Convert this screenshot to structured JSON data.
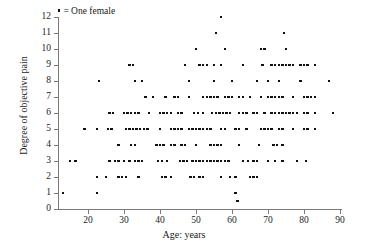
{
  "figure": {
    "legend_text": "= One female",
    "legend_marker": "square-dot-marker"
  },
  "chart_data": {
    "type": "scatter",
    "title": "",
    "xlabel": "Age: years",
    "ylabel": "Degree of objective pain",
    "xlim": [
      12,
      91
    ],
    "ylim": [
      0,
      12
    ],
    "xticks": [
      20,
      30,
      40,
      50,
      60,
      70,
      80,
      90
    ],
    "yticks": [
      0,
      1,
      2,
      3,
      4,
      5,
      6,
      7,
      8,
      9,
      10,
      11,
      12
    ],
    "grid": false,
    "legend_position": "top-left",
    "legend_entries": [
      "= One female"
    ],
    "marker": "square",
    "marker_color": "#111111",
    "marker_size_px": 2.4,
    "note": "Each point represents one female subject; many points overlap at integer pain levels.",
    "points": [
      [
        13,
        1
      ],
      [
        22.5,
        1
      ],
      [
        61,
        1
      ],
      [
        61.5,
        0.5
      ],
      [
        15,
        3
      ],
      [
        16.5,
        3
      ],
      [
        22.5,
        2
      ],
      [
        25,
        2
      ],
      [
        28.5,
        2
      ],
      [
        29.5,
        2
      ],
      [
        30.5,
        2
      ],
      [
        34,
        2
      ],
      [
        40.5,
        2
      ],
      [
        41.5,
        2
      ],
      [
        43,
        2
      ],
      [
        48.5,
        2
      ],
      [
        49.5,
        2
      ],
      [
        51,
        2
      ],
      [
        52,
        2
      ],
      [
        57,
        2
      ],
      [
        59.5,
        2
      ],
      [
        61,
        2
      ],
      [
        65,
        2
      ],
      [
        66,
        2
      ],
      [
        67,
        2
      ],
      [
        26,
        3
      ],
      [
        27.5,
        3
      ],
      [
        28.5,
        3
      ],
      [
        30,
        3
      ],
      [
        31.5,
        3
      ],
      [
        33,
        3
      ],
      [
        34,
        3
      ],
      [
        35,
        3
      ],
      [
        39.5,
        3
      ],
      [
        40.5,
        3
      ],
      [
        42,
        3
      ],
      [
        45.5,
        3
      ],
      [
        46.5,
        3
      ],
      [
        47.5,
        3
      ],
      [
        49,
        3
      ],
      [
        50,
        3
      ],
      [
        51,
        3
      ],
      [
        52,
        3
      ],
      [
        53,
        3
      ],
      [
        54,
        3
      ],
      [
        55,
        3
      ],
      [
        56,
        3
      ],
      [
        57,
        3
      ],
      [
        58,
        3
      ],
      [
        59,
        3
      ],
      [
        63,
        3
      ],
      [
        64.5,
        3
      ],
      [
        66,
        3
      ],
      [
        67,
        3
      ],
      [
        70,
        3
      ],
      [
        72,
        3
      ],
      [
        74,
        3
      ],
      [
        78,
        3
      ],
      [
        80.5,
        3
      ],
      [
        28.5,
        4
      ],
      [
        32,
        4
      ],
      [
        33,
        4
      ],
      [
        39,
        4
      ],
      [
        40,
        4
      ],
      [
        41,
        4
      ],
      [
        43,
        4
      ],
      [
        44,
        4
      ],
      [
        46,
        4
      ],
      [
        47,
        4
      ],
      [
        50,
        4
      ],
      [
        54,
        4
      ],
      [
        55,
        4
      ],
      [
        56,
        4
      ],
      [
        57,
        4
      ],
      [
        62,
        4
      ],
      [
        67.5,
        4
      ],
      [
        71.5,
        4
      ],
      [
        72.5,
        4
      ],
      [
        74,
        4
      ],
      [
        19,
        5
      ],
      [
        22.5,
        5
      ],
      [
        25.5,
        5
      ],
      [
        26.5,
        5
      ],
      [
        30.5,
        5
      ],
      [
        31.5,
        5
      ],
      [
        32.5,
        5
      ],
      [
        33.5,
        5
      ],
      [
        34.5,
        5
      ],
      [
        35.5,
        5
      ],
      [
        36.5,
        5
      ],
      [
        40,
        5
      ],
      [
        43,
        5
      ],
      [
        44,
        5
      ],
      [
        45,
        5
      ],
      [
        46,
        5
      ],
      [
        48,
        5
      ],
      [
        49,
        5
      ],
      [
        50,
        5
      ],
      [
        51,
        5
      ],
      [
        52,
        5
      ],
      [
        53,
        5
      ],
      [
        54,
        5
      ],
      [
        57,
        5
      ],
      [
        58,
        5
      ],
      [
        61,
        5
      ],
      [
        62,
        5
      ],
      [
        64,
        5
      ],
      [
        68,
        5
      ],
      [
        69,
        5
      ],
      [
        70,
        5
      ],
      [
        71,
        5
      ],
      [
        73,
        5
      ],
      [
        74,
        5
      ],
      [
        77,
        5
      ],
      [
        80,
        5
      ],
      [
        81,
        5
      ],
      [
        83,
        5
      ],
      [
        26,
        6
      ],
      [
        27,
        6
      ],
      [
        30,
        6
      ],
      [
        31,
        6
      ],
      [
        32,
        6
      ],
      [
        33,
        6
      ],
      [
        34,
        6
      ],
      [
        37,
        6
      ],
      [
        40,
        6
      ],
      [
        41,
        6
      ],
      [
        42,
        6
      ],
      [
        43,
        6
      ],
      [
        45,
        6
      ],
      [
        46,
        6
      ],
      [
        49.5,
        6
      ],
      [
        50.5,
        6
      ],
      [
        52,
        6
      ],
      [
        54.5,
        6
      ],
      [
        55.5,
        6
      ],
      [
        56.5,
        6
      ],
      [
        57.5,
        6
      ],
      [
        58.5,
        6
      ],
      [
        59.5,
        6
      ],
      [
        62,
        6
      ],
      [
        63,
        6
      ],
      [
        64,
        6
      ],
      [
        66,
        6
      ],
      [
        67,
        6
      ],
      [
        69,
        6
      ],
      [
        71,
        6
      ],
      [
        72,
        6
      ],
      [
        73,
        6
      ],
      [
        74,
        6
      ],
      [
        75,
        6
      ],
      [
        76,
        6
      ],
      [
        77,
        6
      ],
      [
        78,
        6
      ],
      [
        80,
        6
      ],
      [
        81,
        6
      ],
      [
        83,
        6
      ],
      [
        88,
        6
      ],
      [
        44,
        7
      ],
      [
        45,
        7
      ],
      [
        48,
        7
      ],
      [
        52,
        7
      ],
      [
        53,
        7
      ],
      [
        54,
        7
      ],
      [
        55,
        7
      ],
      [
        56,
        7
      ],
      [
        58,
        7
      ],
      [
        59,
        7
      ],
      [
        60,
        7
      ],
      [
        62,
        7
      ],
      [
        63,
        7
      ],
      [
        65,
        7
      ],
      [
        68,
        7
      ],
      [
        70,
        7
      ],
      [
        71,
        7
      ],
      [
        72,
        7
      ],
      [
        73,
        7
      ],
      [
        74,
        7
      ],
      [
        77,
        7
      ],
      [
        80,
        7
      ],
      [
        81,
        7
      ],
      [
        82,
        7
      ],
      [
        83,
        7
      ],
      [
        36,
        7
      ],
      [
        38,
        7
      ],
      [
        41.5,
        7
      ],
      [
        23,
        8
      ],
      [
        33,
        8
      ],
      [
        35,
        8
      ],
      [
        48,
        8
      ],
      [
        55,
        8
      ],
      [
        60,
        8
      ],
      [
        67,
        8
      ],
      [
        70,
        8
      ],
      [
        73,
        8
      ],
      [
        79,
        8
      ],
      [
        87,
        8
      ],
      [
        31.5,
        9
      ],
      [
        32.5,
        9
      ],
      [
        47,
        9
      ],
      [
        51,
        9
      ],
      [
        52,
        9
      ],
      [
        53,
        9
      ],
      [
        55,
        9
      ],
      [
        57,
        9
      ],
      [
        63,
        9
      ],
      [
        68.5,
        9
      ],
      [
        71,
        9
      ],
      [
        72,
        9
      ],
      [
        73,
        9
      ],
      [
        74,
        9
      ],
      [
        75,
        9
      ],
      [
        76,
        9
      ],
      [
        77,
        9
      ],
      [
        79,
        9
      ],
      [
        80,
        9
      ],
      [
        81,
        9
      ],
      [
        83,
        9
      ],
      [
        50,
        10
      ],
      [
        58,
        10
      ],
      [
        68,
        10
      ],
      [
        69,
        10
      ],
      [
        75,
        10
      ],
      [
        55.5,
        11
      ],
      [
        74.5,
        11
      ],
      [
        57,
        12
      ]
    ]
  }
}
